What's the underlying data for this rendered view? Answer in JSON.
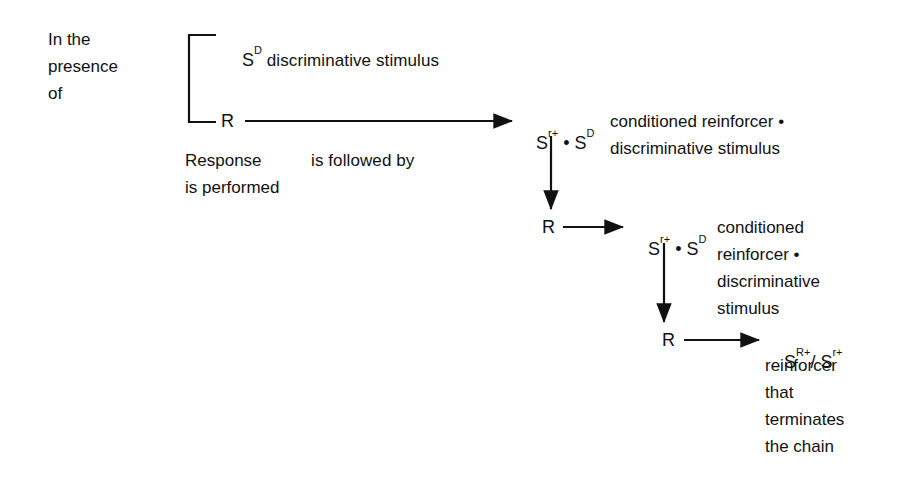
{
  "diagram": {
    "stroke_color": "#111111",
    "background_color": "#ffffff",
    "left_label": {
      "lines": [
        "In the",
        "presence",
        "of"
      ]
    },
    "tier1": {
      "top_symbol": "S",
      "top_symbol_sup": "D",
      "top_text": " discriminative stimulus",
      "response_symbol": "R",
      "caption_left": [
        "Response",
        "is performed"
      ],
      "caption_mid": [
        "is followed by"
      ],
      "outcome_symbol_1": "S",
      "outcome_symbol_1_sup": "r+",
      "outcome_joiner": " • ",
      "outcome_symbol_2": "S",
      "outcome_symbol_2_sup": "D",
      "outcome_text": [
        "conditioned reinforcer •",
        "discriminative stimulus"
      ]
    },
    "tier2": {
      "response_symbol": "R",
      "outcome_symbol_1": "S",
      "outcome_symbol_1_sup": "r+",
      "outcome_joiner": " • ",
      "outcome_symbol_2": "S",
      "outcome_symbol_2_sup": "D",
      "outcome_text": [
        "conditioned",
        "reinforcer •",
        "discriminative",
        "stimulus"
      ]
    },
    "tier3": {
      "response_symbol": "R",
      "outcome_symbol_1": "S",
      "outcome_symbol_1_sup": "R+",
      "outcome_joiner": "/ ",
      "outcome_symbol_2": "S",
      "outcome_symbol_2_sup": "r+",
      "outcome_text": [
        "reinforcer",
        "that",
        "terminates",
        "the chain"
      ]
    }
  }
}
